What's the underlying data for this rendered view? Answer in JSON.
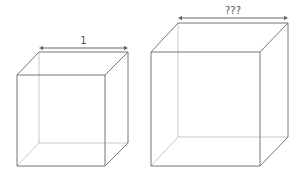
{
  "diagram": {
    "cubes": [
      {
        "id": "small-cube",
        "dimension_label": "1",
        "front": [
          17,
          75,
          105,
          166
        ],
        "back": [
          39,
          52,
          128,
          143
        ],
        "arrow_y": 48
      },
      {
        "id": "large-cube",
        "dimension_label": "???",
        "front": [
          151,
          52,
          260,
          166
        ],
        "back": [
          178,
          23,
          288,
          137
        ],
        "arrow_y": 18
      }
    ],
    "colors": {
      "edge": "#777777",
      "hidden_edge": "#bbbbbb",
      "arrow": "#666666"
    }
  }
}
